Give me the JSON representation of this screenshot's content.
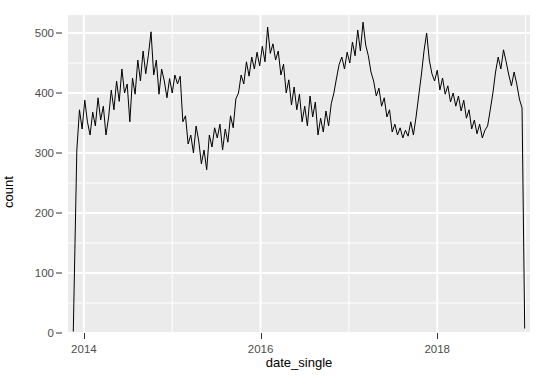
{
  "chart_data": {
    "type": "line",
    "title": "",
    "xlabel": "date_single",
    "ylabel": "count",
    "xlim": [
      2013.82,
      2019.05
    ],
    "ylim": [
      0,
      530
    ],
    "y_ticks": [
      0,
      100,
      200,
      300,
      400,
      500
    ],
    "y_tick_labels": [
      "0",
      "100",
      "200",
      "300",
      "400",
      "500"
    ],
    "y_minor_ticks": [
      50,
      150,
      250,
      350,
      450
    ],
    "x_ticks": [
      2014,
      2016,
      2018
    ],
    "x_tick_labels": [
      "2014",
      "2016",
      "2018"
    ],
    "x_minor_ticks": [
      2015,
      2017,
      2019
    ],
    "grid": true,
    "legend": "none",
    "line_color": "#000000",
    "line_width": 1.0,
    "panel_background": "#ebebeb",
    "grid_color": "#ffffff",
    "axis_text_color": "#4d4d4d",
    "series": [
      {
        "name": "count",
        "x": [
          2013.88,
          2013.92,
          2013.95,
          2013.98,
          2014.01,
          2014.04,
          2014.07,
          2014.1,
          2014.13,
          2014.16,
          2014.19,
          2014.22,
          2014.25,
          2014.28,
          2014.31,
          2014.34,
          2014.37,
          2014.4,
          2014.43,
          2014.46,
          2014.49,
          2014.52,
          2014.55,
          2014.58,
          2014.61,
          2014.64,
          2014.67,
          2014.7,
          2014.73,
          2014.76,
          2014.79,
          2014.82,
          2014.85,
          2014.88,
          2014.91,
          2014.94,
          2014.97,
          2015.0,
          2015.03,
          2015.06,
          2015.09,
          2015.12,
          2015.15,
          2015.18,
          2015.21,
          2015.24,
          2015.27,
          2015.3,
          2015.33,
          2015.36,
          2015.39,
          2015.42,
          2015.45,
          2015.48,
          2015.51,
          2015.54,
          2015.57,
          2015.6,
          2015.63,
          2015.66,
          2015.69,
          2015.72,
          2015.75,
          2015.78,
          2015.81,
          2015.84,
          2015.87,
          2015.9,
          2015.93,
          2015.96,
          2015.99,
          2016.02,
          2016.05,
          2016.08,
          2016.11,
          2016.14,
          2016.17,
          2016.2,
          2016.23,
          2016.26,
          2016.29,
          2016.32,
          2016.35,
          2016.38,
          2016.41,
          2016.44,
          2016.47,
          2016.5,
          2016.53,
          2016.56,
          2016.59,
          2016.62,
          2016.65,
          2016.68,
          2016.71,
          2016.74,
          2016.77,
          2016.8,
          2016.83,
          2016.86,
          2016.89,
          2016.92,
          2016.95,
          2016.98,
          2017.01,
          2017.04,
          2017.07,
          2017.1,
          2017.13,
          2017.16,
          2017.19,
          2017.22,
          2017.25,
          2017.28,
          2017.31,
          2017.34,
          2017.37,
          2017.4,
          2017.43,
          2017.46,
          2017.49,
          2017.52,
          2017.55,
          2017.58,
          2017.61,
          2017.64,
          2017.67,
          2017.7,
          2017.73,
          2017.76,
          2017.79,
          2017.82,
          2017.85,
          2017.88,
          2017.91,
          2017.94,
          2017.97,
          2018.0,
          2018.03,
          2018.06,
          2018.09,
          2018.12,
          2018.15,
          2018.18,
          2018.21,
          2018.24,
          2018.27,
          2018.3,
          2018.33,
          2018.36,
          2018.39,
          2018.42,
          2018.45,
          2018.48,
          2018.51,
          2018.54,
          2018.57,
          2018.6,
          2018.63,
          2018.66,
          2018.69,
          2018.72,
          2018.75,
          2018.78,
          2018.81,
          2018.84,
          2018.87,
          2018.9,
          2018.93,
          2018.96,
          2018.99
        ],
        "y": [
          3,
          305,
          372,
          340,
          388,
          352,
          330,
          368,
          345,
          392,
          355,
          378,
          330,
          360,
          405,
          372,
          420,
          386,
          440,
          400,
          415,
          352,
          425,
          398,
          455,
          420,
          470,
          432,
          463,
          502,
          430,
          455,
          398,
          440,
          420,
          392,
          424,
          400,
          430,
          415,
          428,
          352,
          362,
          315,
          330,
          300,
          345,
          320,
          282,
          305,
          272,
          330,
          310,
          342,
          325,
          348,
          305,
          340,
          318,
          362,
          342,
          390,
          400,
          430,
          415,
          452,
          428,
          460,
          440,
          468,
          445,
          478,
          452,
          510,
          466,
          482,
          455,
          470,
          430,
          448,
          400,
          422,
          380,
          410,
          372,
          398,
          352,
          378,
          345,
          395,
          360,
          385,
          330,
          358,
          335,
          370,
          345,
          382,
          400,
          425,
          448,
          460,
          440,
          468,
          450,
          485,
          462,
          505,
          470,
          518,
          480,
          462,
          435,
          420,
          395,
          408,
          378,
          392,
          360,
          372,
          335,
          348,
          330,
          342,
          325,
          338,
          328,
          352,
          330,
          360,
          395,
          430,
          470,
          500,
          455,
          432,
          420,
          438,
          405,
          425,
          398,
          412,
          385,
          400,
          378,
          395,
          370,
          388,
          358,
          372,
          340,
          355,
          332,
          348,
          325,
          338,
          345,
          372,
          400,
          435,
          460,
          440,
          472,
          452,
          430,
          412,
          435,
          415,
          390,
          375,
          8
        ]
      }
    ]
  },
  "axes": {
    "y_title": "count",
    "x_title": "date_single"
  }
}
